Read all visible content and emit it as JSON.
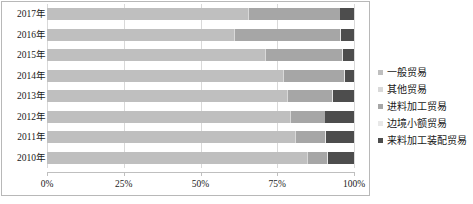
{
  "chart_data": {
    "type": "bar",
    "orientation": "horizontal",
    "stacked": true,
    "normalized": true,
    "title": "",
    "xlabel": "",
    "ylabel": "",
    "xlim": [
      0,
      100
    ],
    "xticks": [
      "0%",
      "25%",
      "50%",
      "75%",
      "100%"
    ],
    "xtick_values": [
      0,
      25,
      50,
      75,
      100
    ],
    "grid": true,
    "legend_position": "right",
    "categories": [
      "2017年",
      "2016年",
      "2015年",
      "2014年",
      "2013年",
      "2012年",
      "2011年",
      "2010年"
    ],
    "series": [
      {
        "name": "一般贸易",
        "color": "#bfbfbf",
        "values": [
          65.4,
          60.9,
          71.0,
          76.9,
          78.2,
          79.0,
          80.8,
          84.7
        ]
      },
      {
        "name": "其他贸易",
        "color": "#d9d9d9",
        "values": [
          0.4,
          0.4,
          0.4,
          0.4,
          0.4,
          0.4,
          0.4,
          0.4
        ]
      },
      {
        "name": "进料加工贸易",
        "color": "#a6a6a6",
        "values": [
          29.5,
          34.3,
          24.7,
          19.6,
          14.3,
          11.0,
          9.4,
          6.1
        ]
      },
      {
        "name": "边境小额贸易",
        "color": "#e8e8e8",
        "values": [
          0.3,
          0.3,
          0.3,
          0.3,
          0.3,
          0.3,
          0.3,
          0.3
        ]
      },
      {
        "name": "来料加工装配贸易",
        "color": "#4d4d4d",
        "values": [
          4.4,
          4.1,
          3.6,
          2.8,
          6.8,
          9.3,
          9.1,
          8.5
        ]
      }
    ]
  },
  "legend": {
    "items": [
      {
        "label": "一般贸易",
        "color": "#bfbfbf"
      },
      {
        "label": "其他贸易",
        "color": "#d9d9d9"
      },
      {
        "label": "进料加工贸易",
        "color": "#a6a6a6"
      },
      {
        "label": "边境小额贸易",
        "color": "#e8e8e8"
      },
      {
        "label": "来料加工装配贸易",
        "color": "#4d4d4d"
      }
    ]
  },
  "colors": {
    "plot_border": "#b8b8b8",
    "gridline": "#d9d9d9",
    "axis": "#bfbfbf",
    "text": "#1a1a1a",
    "background": "#ffffff"
  }
}
